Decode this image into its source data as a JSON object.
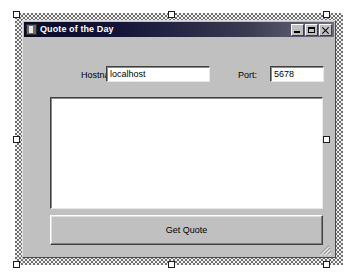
{
  "designer": {
    "surface_name": "form-design-surface",
    "grid_color": "#6e6e6e",
    "hatch_border_light": "#f2f2f2",
    "hatch_border_dark": "#707070",
    "handle_count": 8
  },
  "window": {
    "title": "Quote of the Day",
    "icon": "form-app-icon",
    "titlebar_color_start": "#0a0a28",
    "titlebar_color_end": "#6e6e80",
    "face_color": "#c0c0c0",
    "controls": [
      {
        "name": "minimize-button",
        "glyph": "minimize-icon",
        "tooltip": "Minimize"
      },
      {
        "name": "maximize-button",
        "glyph": "maximize-icon",
        "tooltip": "Maximize"
      },
      {
        "name": "close-button",
        "glyph": "close-icon",
        "tooltip": "Close"
      }
    ]
  },
  "form": {
    "hostname": {
      "label": "Hostname:",
      "value": "localhost",
      "placeholder": ""
    },
    "port": {
      "label": "Port:",
      "value": "5678",
      "placeholder": ""
    },
    "quote_box": {
      "value": "",
      "placeholder": "",
      "multiline": true,
      "readonly": false
    },
    "action_button": {
      "label": "Get Quote"
    },
    "resize_grip": "resize-grip"
  }
}
